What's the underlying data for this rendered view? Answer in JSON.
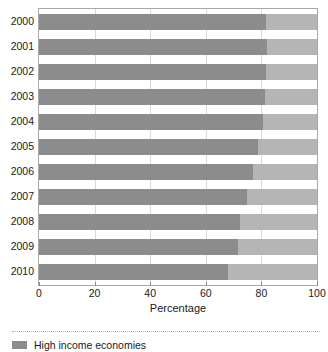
{
  "chart_data": {
    "type": "bar",
    "orientation": "horizontal",
    "stacked": true,
    "title": "",
    "xlabel": "Percentage",
    "ylabel": "",
    "xlim": [
      0,
      100
    ],
    "xticks": [
      0,
      20,
      40,
      60,
      80,
      100
    ],
    "xtick_labels": [
      "0",
      "20",
      "40",
      "60",
      "80",
      "100"
    ],
    "grid": true,
    "grid_axis": "x",
    "legend_position": "bottom-left",
    "categories": [
      "2000",
      "2001",
      "2002",
      "2003",
      "2004",
      "2005",
      "2006",
      "2007",
      "2008",
      "2009",
      "2010"
    ],
    "series": [
      {
        "name": "High income economies",
        "color": "#8c8c8c",
        "values": [
          81.8,
          81.9,
          81.7,
          81.4,
          80.6,
          78.9,
          76.9,
          74.7,
          72.4,
          71.6,
          68.0
        ]
      },
      {
        "name": "",
        "color": "#b5b5b5",
        "values": [
          18.2,
          18.1,
          18.3,
          18.6,
          19.4,
          21.1,
          23.1,
          25.3,
          27.6,
          28.4,
          32.0
        ]
      }
    ],
    "legend": [
      {
        "label": "High income economies",
        "color": "#8c8c8c"
      }
    ]
  },
  "colors": {
    "high_income": "#8c8c8c",
    "remainder": "#b5b5b5",
    "axis": "#a9a9a9",
    "grid": "#d8d8d8",
    "text": "#1a1a1a"
  }
}
